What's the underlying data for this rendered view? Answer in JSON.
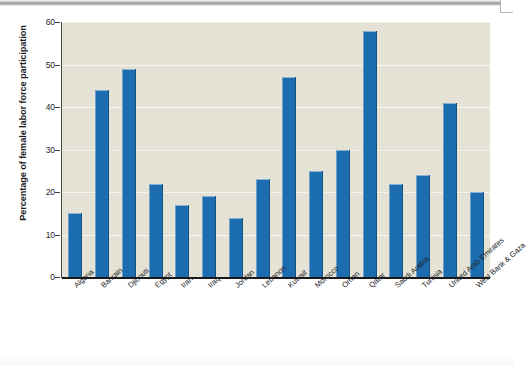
{
  "figure": {
    "background_color": "#ffffff",
    "plot_background_color": "#e6e4d6",
    "bar_color": "#1c6cb0",
    "gridline_color": "#f4f3ec",
    "axis_color": "#18181a"
  },
  "chart_data": {
    "type": "bar",
    "title": "",
    "xlabel": "",
    "ylabel": "Percentage of female labor force participation",
    "ylim": [
      0,
      60
    ],
    "ytick_labels": [
      "0",
      "10",
      "20",
      "30",
      "40",
      "50",
      "60"
    ],
    "ytick_values": [
      0,
      10,
      20,
      30,
      40,
      50,
      60
    ],
    "grid": true,
    "grid_axis": "y",
    "legend": false,
    "legend_position": "none",
    "categories": [
      "Algeria",
      "Bahrain",
      "Djibouti",
      "Egypt",
      "Iran",
      "Iraq",
      "Jordan",
      "Lebanon",
      "Kuwait",
      "Morocco",
      "Oman",
      "Qatar",
      "Saudi Arabia",
      "Tunisia",
      "United Arab Emirates",
      "West Bank & Gaza"
    ],
    "values": [
      15,
      44,
      49,
      22,
      17,
      19,
      14,
      23,
      47,
      25,
      30,
      58,
      22,
      24,
      41,
      20
    ]
  }
}
